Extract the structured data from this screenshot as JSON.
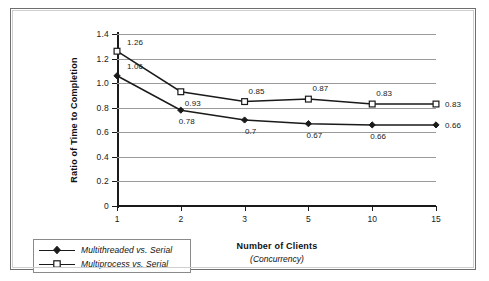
{
  "chart_data": {
    "type": "line",
    "title": "",
    "xlabel": "Number of Clients",
    "xlabel_sub": "(Concurrency)",
    "ylabel": "Ratio of Time to Completion",
    "categories": [
      "1",
      "2",
      "3",
      "5",
      "10",
      "15"
    ],
    "ylim": [
      0,
      1.4
    ],
    "yticks": [
      "0",
      "0.2",
      "0.4",
      "0.6",
      "0.8",
      "1.0",
      "1.2",
      "1.4"
    ],
    "ytick_values": [
      0,
      0.2,
      0.4,
      0.6,
      0.8,
      1.0,
      1.2,
      1.4
    ],
    "grid": "horizontal",
    "legend_position": "bottom-left",
    "series": [
      {
        "name": "Multithreaded vs. Serial",
        "marker": "filled-diamond",
        "color": "#1a1a1a",
        "values": [
          1.06,
          0.78,
          0.7,
          0.67,
          0.66,
          0.66
        ],
        "labels": [
          "1.06",
          "0.78",
          "0.7",
          "0.67",
          "0.66",
          "0.66"
        ]
      },
      {
        "name": "Multiprocess vs. Serial",
        "marker": "open-square",
        "color": "#1a1a1a",
        "values": [
          1.26,
          0.93,
          0.85,
          0.87,
          0.83,
          0.83
        ],
        "labels": [
          "1.26",
          "0.93",
          "0.85",
          "0.87",
          "0.83",
          "0.83"
        ]
      }
    ]
  },
  "legend": {
    "items": [
      {
        "label": "Multithreaded vs. Serial",
        "marker": "filled-diamond"
      },
      {
        "label": "Multiprocess vs. Serial",
        "marker": "open-square"
      }
    ]
  },
  "colors": {
    "line": "#1a1a1a",
    "grid": "#9a9a9a",
    "axis": "#1a1a1a",
    "frame": "#6e6e6e"
  }
}
